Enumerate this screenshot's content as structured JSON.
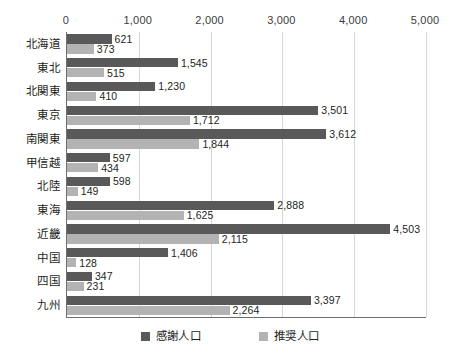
{
  "chart_data": {
    "type": "bar",
    "orientation": "horizontal",
    "title": "",
    "subtitle": "",
    "xlabel": "",
    "ylabel": "",
    "xlim": [
      0,
      5000
    ],
    "xticks": [
      0,
      1000,
      2000,
      3000,
      4000,
      5000
    ],
    "xtick_labels": [
      "0",
      "1,000",
      "2,000",
      "3,000",
      "4,000",
      "5,000"
    ],
    "grid": true,
    "grid_axis": "x",
    "legend_position": "bottom",
    "categories": [
      "北海道",
      "東北",
      "北関東",
      "東京",
      "南関東",
      "甲信越",
      "北陸",
      "東海",
      "近畿",
      "中国",
      "四国",
      "九州"
    ],
    "series": [
      {
        "name": "感謝人口",
        "color": "#595959",
        "values": [
          621,
          1545,
          1230,
          3501,
          3612,
          597,
          598,
          2888,
          4503,
          1406,
          347,
          3397
        ],
        "labels": [
          "621",
          "1,545",
          "1,230",
          "3,501",
          "3,612",
          "597",
          "598",
          "2,888",
          "4,503",
          "1,406",
          "347",
          "3,397"
        ]
      },
      {
        "name": "推奨人口",
        "color": "#b3b3b3",
        "values": [
          373,
          515,
          410,
          1712,
          1844,
          434,
          149,
          1625,
          2115,
          128,
          231,
          2264
        ],
        "labels": [
          "373",
          "515",
          "410",
          "1,712",
          "1,844",
          "434",
          "149",
          "1,625",
          "2,115",
          "128",
          "231",
          "2,264"
        ]
      }
    ]
  },
  "legend": {
    "items": [
      {
        "label": "感謝人口",
        "color": "#595959"
      },
      {
        "label": "推奨人口",
        "color": "#b3b3b3"
      }
    ]
  },
  "colors": {
    "series_dark": "#595959",
    "series_light": "#b3b3b3",
    "gridline": "#d6d6d6",
    "axis": "#6e6e6e",
    "text": "#231f20",
    "background": "#ffffff"
  }
}
